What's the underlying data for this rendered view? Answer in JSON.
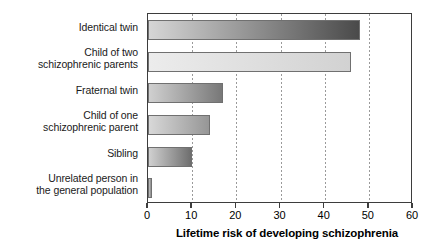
{
  "chart_data": {
    "type": "bar",
    "orientation": "horizontal",
    "title": "",
    "xlabel": "Lifetime risk of developing schizophrenia",
    "ylabel": "",
    "xlim": [
      0,
      60
    ],
    "xticks": [
      0,
      10,
      20,
      30,
      40,
      50,
      60
    ],
    "xtick_labels": [
      "0",
      "10",
      "20",
      "30",
      "40",
      "50",
      "60"
    ],
    "grid": true,
    "grid_axis": "x",
    "legend": "none",
    "categories": [
      "Identical twin",
      "Child of two\nschizophrenic parents",
      "Fraternal twin",
      "Child of one\nschizophrenic parent",
      "Sibling",
      "Unrelated person in\nthe general population"
    ],
    "values": [
      48,
      46,
      17,
      14,
      10,
      1
    ],
    "bar_fills": [
      {
        "from": "#d6d6d6",
        "to": "#4a4a4a"
      },
      {
        "from": "#ececec",
        "to": "#d2d2d2"
      },
      {
        "from": "#d0d0d0",
        "to": "#787878"
      },
      {
        "from": "#d8d8d8",
        "to": "#969696"
      },
      {
        "from": "#d0d0d0",
        "to": "#6e6e6e"
      },
      {
        "from": "#c4c4c4",
        "to": "#8a8a8a"
      }
    ],
    "bar_border_color": "#707070",
    "axis_color": "#3d3d3d",
    "grid_color": "#9a9a9a",
    "background": "#ffffff"
  }
}
